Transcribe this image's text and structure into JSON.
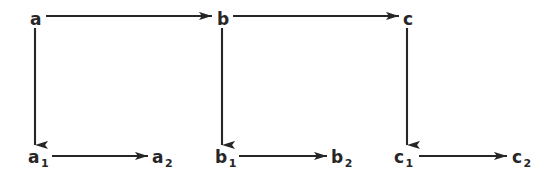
{
  "figure": {
    "kind": "commutative-diagram",
    "background_color": "#ffffff",
    "ink_color": "#262626",
    "width": 558,
    "height": 173
  },
  "nodes": [
    {
      "id": "a",
      "base": "a",
      "sub": "",
      "x": 30,
      "y": 11,
      "row": "top",
      "col": 0
    },
    {
      "id": "b",
      "base": "b",
      "sub": "",
      "x": 217,
      "y": 11,
      "row": "top",
      "col": 1
    },
    {
      "id": "c",
      "base": "c",
      "sub": "",
      "x": 403,
      "y": 11,
      "row": "top",
      "col": 2
    },
    {
      "id": "a1",
      "base": "a",
      "sub": "1",
      "x": 28,
      "y": 149,
      "row": "bottom",
      "col": 0
    },
    {
      "id": "a2",
      "base": "a",
      "sub": "2",
      "x": 152,
      "y": 149,
      "row": "bottom",
      "col": 0
    },
    {
      "id": "b1",
      "base": "b",
      "sub": "1",
      "x": 215,
      "y": 149,
      "row": "bottom",
      "col": 1
    },
    {
      "id": "b2",
      "base": "b",
      "sub": "2",
      "x": 331,
      "y": 149,
      "row": "bottom",
      "col": 1
    },
    {
      "id": "c1",
      "base": "c",
      "sub": "1",
      "x": 394,
      "y": 149,
      "row": "bottom",
      "col": 2
    },
    {
      "id": "c2",
      "base": "c",
      "sub": "2",
      "x": 512,
      "y": 149,
      "row": "bottom",
      "col": 2
    }
  ],
  "arrows": [
    {
      "id": "a-to-b",
      "from": "a",
      "to": "b",
      "orientation": "horizontal",
      "x1": 46,
      "y1": 16,
      "x2": 212,
      "y2": 16
    },
    {
      "id": "b-to-c",
      "from": "b",
      "to": "c",
      "orientation": "horizontal",
      "x1": 233,
      "y1": 16,
      "x2": 399,
      "y2": 16
    },
    {
      "id": "a-to-a1",
      "from": "a",
      "to": "a1",
      "orientation": "vertical",
      "x1": 35,
      "y1": 28,
      "x2": 35,
      "y2": 145
    },
    {
      "id": "b-to-b1",
      "from": "b",
      "to": "b1",
      "orientation": "vertical",
      "x1": 222,
      "y1": 28,
      "x2": 222,
      "y2": 145
    },
    {
      "id": "c-to-c1",
      "from": "c",
      "to": "c1",
      "orientation": "vertical",
      "x1": 407,
      "y1": 28,
      "x2": 407,
      "y2": 145
    },
    {
      "id": "a1-to-a2",
      "from": "a1",
      "to": "a2",
      "orientation": "horizontal",
      "x1": 52,
      "y1": 156,
      "x2": 148,
      "y2": 156
    },
    {
      "id": "b1-to-b2",
      "from": "b1",
      "to": "b2",
      "orientation": "horizontal",
      "x1": 239,
      "y1": 156,
      "x2": 327,
      "y2": 156
    },
    {
      "id": "c1-to-c2",
      "from": "c1",
      "to": "c2",
      "orientation": "horizontal",
      "x1": 419,
      "y1": 156,
      "x2": 507,
      "y2": 156
    }
  ]
}
